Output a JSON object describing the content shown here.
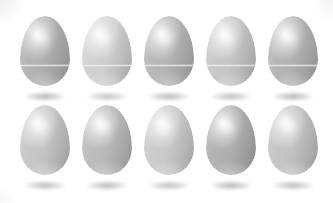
{
  "scene": {
    "title": "Ten eggs arranged in two rows of five",
    "background_color": "#ffffff",
    "width": 333,
    "height": 203,
    "object_name": "egg",
    "object_count": 10,
    "rows": 2,
    "columns": 5
  },
  "rows": [
    {
      "name": "top-row",
      "label": "Top row of eggs",
      "has_seam": true,
      "seam_label": "egg seam line",
      "count": 5,
      "eggs": [
        {
          "label": "egg 1",
          "tone": "#b0b0b1",
          "shadow_opacity": 0.5
        },
        {
          "label": "egg 2",
          "tone": "#cfcfd0",
          "shadow_opacity": 0.42
        },
        {
          "label": "egg 3",
          "tone": "#b4b4b5",
          "shadow_opacity": 0.48
        },
        {
          "label": "egg 4",
          "tone": "#c6c6c7",
          "shadow_opacity": 0.44
        },
        {
          "label": "egg 5",
          "tone": "#b2b2b3",
          "shadow_opacity": 0.5
        }
      ]
    },
    {
      "name": "bottom-row",
      "label": "Bottom row of eggs",
      "has_seam": false,
      "seam_label": "",
      "count": 5,
      "eggs": [
        {
          "label": "egg 6",
          "tone": "#c4c4c5",
          "shadow_opacity": 0.46
        },
        {
          "label": "egg 7",
          "tone": "#b9b9ba",
          "shadow_opacity": 0.48
        },
        {
          "label": "egg 8",
          "tone": "#c9c9ca",
          "shadow_opacity": 0.44
        },
        {
          "label": "egg 9",
          "tone": "#aeaeaf",
          "shadow_opacity": 0.52
        },
        {
          "label": "egg 10",
          "tone": "#c2c2c3",
          "shadow_opacity": 0.46
        }
      ]
    }
  ],
  "layout": {
    "column_x": [
      18,
      80,
      142,
      204,
      266
    ],
    "row_y": [
      14,
      103
    ],
    "egg_width": 50,
    "egg_height": 70
  }
}
